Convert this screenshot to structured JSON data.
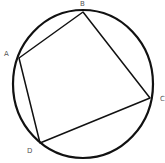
{
  "diagram": {
    "type": "cyclic-quadrilateral",
    "circle": {
      "cx": 83,
      "cy": 84,
      "rx": 70,
      "ry": 74,
      "stroke": "#111111",
      "stroke_width": 2.2
    },
    "vertices": [
      {
        "label": "A",
        "x": 19,
        "y": 58,
        "label_x": 4,
        "label_y": 56
      },
      {
        "label": "B",
        "x": 83,
        "y": 12,
        "label_x": 80,
        "label_y": 6
      },
      {
        "label": "C",
        "x": 150,
        "y": 98,
        "label_x": 160,
        "label_y": 101
      },
      {
        "label": "D",
        "x": 40,
        "y": 143,
        "label_x": 27,
        "label_y": 153
      }
    ],
    "edges": [
      [
        "A",
        "B"
      ],
      [
        "B",
        "C"
      ],
      [
        "C",
        "D"
      ],
      [
        "D",
        "A"
      ]
    ],
    "line_color": "#111111",
    "line_width": 1.5
  }
}
